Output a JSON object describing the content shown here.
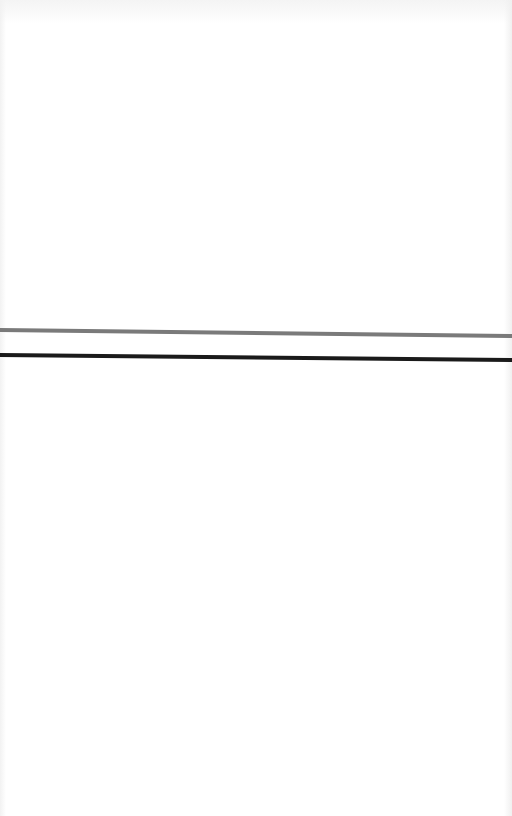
{
  "page": {
    "background": "#ffffff",
    "width": 512,
    "height": 816
  },
  "rules": [
    {
      "name": "gray-rule",
      "color": "#7a7a7a",
      "x1": 0,
      "y1": 330,
      "x2": 512,
      "y2": 336,
      "thickness": 4
    },
    {
      "name": "black-rule",
      "color": "#1a1a1a",
      "x1": 0,
      "y1": 355,
      "x2": 512,
      "y2": 360,
      "thickness": 4
    }
  ]
}
